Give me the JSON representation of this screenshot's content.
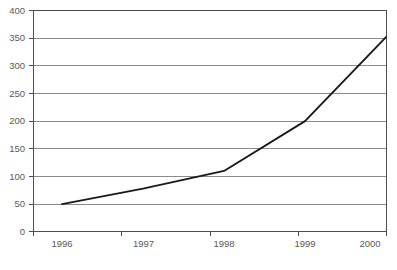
{
  "chart_data": {
    "type": "line",
    "title": "",
    "subtitle": "",
    "xlabel": "",
    "ylabel": "",
    "x": [
      "1996",
      "1997",
      "1998",
      "1999",
      "2000"
    ],
    "categories": [
      "1996",
      "1997",
      "1998",
      "1999",
      "2000"
    ],
    "values": [
      50,
      78,
      110,
      200,
      352
    ],
    "series": [
      {
        "name": "",
        "values": [
          50,
          78,
          110,
          200,
          352
        ]
      }
    ],
    "ylim": [
      0,
      400
    ],
    "yticks": [
      0,
      50,
      100,
      150,
      200,
      250,
      300,
      350,
      400
    ],
    "ytick_labels": [
      "0",
      "50",
      "100",
      "150",
      "200",
      "250",
      "300",
      "350",
      "400"
    ],
    "xtick_labels": [
      "1996",
      "1997",
      "1998",
      "1999",
      "2000"
    ],
    "grid": "horizontal",
    "legend": "none",
    "line_color": "#1a1a1a",
    "grid_color": "#808080",
    "frame_color": "#4d4d4d",
    "background": "#ffffff",
    "annotations": []
  },
  "axes": {
    "y": {
      "ticks": [
        {
          "label": "400",
          "value": 400
        },
        {
          "label": "350",
          "value": 350
        },
        {
          "label": "300",
          "value": 300
        },
        {
          "label": "250",
          "value": 250
        },
        {
          "label": "200",
          "value": 200
        },
        {
          "label": "150",
          "value": 150
        },
        {
          "label": "100",
          "value": 100
        },
        {
          "label": "50",
          "value": 50
        },
        {
          "label": "0",
          "value": 0
        }
      ]
    },
    "x": {
      "ticks": [
        {
          "label": "1996"
        },
        {
          "label": "1997"
        },
        {
          "label": "1998"
        },
        {
          "label": "1999"
        },
        {
          "label": "2000"
        }
      ]
    }
  },
  "caption": {
    "text": ""
  }
}
